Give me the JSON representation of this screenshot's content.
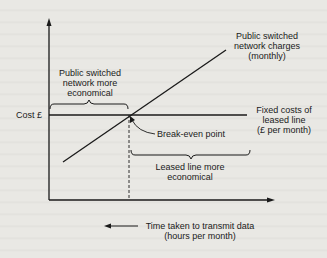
{
  "diagram": {
    "y_axis_label": "Cost £",
    "x_axis_label_line1": "Time taken to transmit data",
    "x_axis_label_line2": "(hours per month)",
    "psn_line_label_line1": "Public switched",
    "psn_line_label_line2": "network charges",
    "psn_line_label_line3": "(monthly)",
    "fixed_line_label_line1": "Fixed costs of",
    "fixed_line_label_line2": "leased line",
    "fixed_line_label_line3": "(£ per month)",
    "psn_region_label_line1": "Public switched",
    "psn_region_label_line2": "network more",
    "psn_region_label_line3": "economical",
    "leased_region_label_line1": "Leased line more",
    "leased_region_label_line2": "economical",
    "break_even_label": "Break-even point"
  }
}
